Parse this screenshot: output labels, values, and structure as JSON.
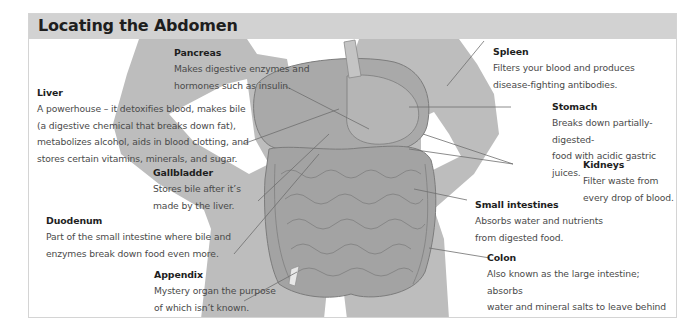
{
  "header": {
    "title": "Locating the Abdomen"
  },
  "colors": {
    "header_bg": "#d2d2d2",
    "silhouette": "#bdbdbd",
    "organ": "#a9a9a9",
    "text": "#4a4a4a",
    "heading": "#1e1e1e",
    "leader_line": "#6e6e6e"
  },
  "labels": {
    "pancreas": {
      "name": "Pancreas",
      "desc": "Makes digestive enzymes and\nhormones such as insulin."
    },
    "liver": {
      "name": "Liver",
      "desc": "A powerhouse – it detoxifies blood, makes bile\n(a digestive chemical that breaks down fat),\nmetabolizes alcohol, aids in blood clotting, and\nstores certain vitamins, minerals, and sugar."
    },
    "gallbladder": {
      "name": "Gallbladder",
      "desc": "Stores bile after it’s\nmade by the liver."
    },
    "duodenum": {
      "name": "Duodenum",
      "desc": "Part of the small intestine where bile and\nenzymes break down food even more."
    },
    "appendix": {
      "name": "Appendix",
      "desc": "Mystery organ the purpose\nof which isn’t known."
    },
    "spleen": {
      "name": "Spleen",
      "desc": "Filters your blood and produces\ndisease-fighting antibodies."
    },
    "stomach": {
      "name": "Stomach",
      "desc": "Breaks down partially-digested-\nfood with acidic gastric juices."
    },
    "kidneys": {
      "name": "Kidneys",
      "desc": "Filter waste from\nevery drop of blood."
    },
    "small_intestines": {
      "name": "Small intestines",
      "desc": "Absorbs water and nutrients\nfrom digested food."
    },
    "colon": {
      "name": "Colon",
      "desc": "Also known as the large intestine; absorbs\nwater and mineral salts to leave behind\nwaste that forms into stool."
    }
  }
}
